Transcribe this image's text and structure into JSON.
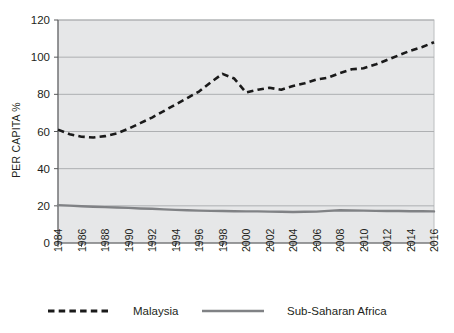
{
  "chart_data": {
    "type": "line",
    "title": "",
    "xlabel": "",
    "ylabel": "PER CAPITA %",
    "ylim": [
      0,
      120
    ],
    "ytick_values": [
      0,
      20,
      40,
      60,
      80,
      100,
      120
    ],
    "ytick_labels": [
      "0",
      "20",
      "40",
      "60",
      "80",
      "100",
      "120"
    ],
    "xlim": [
      1984,
      2016
    ],
    "xtick_labels": [
      "1984",
      "1986",
      "1988",
      "1990",
      "1992",
      "1994",
      "1996",
      "1998",
      "2000",
      "2002",
      "2004",
      "2006",
      "2008",
      "2010",
      "2012",
      "2014",
      "2016"
    ],
    "x": [
      1984,
      1985,
      1986,
      1987,
      1988,
      1989,
      1990,
      1991,
      1992,
      1993,
      1994,
      1995,
      1996,
      1997,
      1998,
      1999,
      2000,
      2001,
      2002,
      2003,
      2004,
      2005,
      2006,
      2007,
      2008,
      2009,
      2010,
      2011,
      2012,
      2013,
      2014,
      2015,
      2016
    ],
    "grid": true,
    "legend_position": "bottom",
    "series": [
      {
        "name": "Malaysia",
        "style": "dashed",
        "color": "#1a1a1a",
        "values": [
          61.0,
          58.5,
          57.2,
          56.8,
          57.5,
          59.0,
          61.5,
          64.5,
          67.5,
          71.0,
          74.5,
          78.0,
          81.5,
          86.5,
          91.0,
          88.5,
          81.0,
          82.5,
          83.5,
          82.5,
          84.5,
          86.0,
          88.0,
          89.0,
          91.5,
          93.5,
          94.0,
          96.0,
          98.5,
          101.0,
          103.5,
          105.5,
          108.0
        ]
      },
      {
        "name": "Sub-Saharan Africa",
        "style": "solid",
        "color": "#808285",
        "values": [
          20.4,
          20.1,
          19.8,
          19.5,
          19.3,
          19.1,
          18.9,
          18.6,
          18.4,
          18.1,
          17.8,
          17.6,
          17.4,
          17.3,
          17.2,
          17.1,
          17.0,
          17.0,
          16.9,
          16.8,
          16.7,
          16.8,
          16.9,
          17.3,
          17.6,
          17.5,
          17.4,
          17.3,
          17.2,
          17.2,
          17.1,
          17.1,
          17.0
        ]
      }
    ]
  },
  "legend": {
    "items": [
      {
        "label": "Malaysia",
        "style": "dashed"
      },
      {
        "label": "Sub-Saharan Africa",
        "style": "solid"
      }
    ]
  },
  "axis": {
    "y_title": "PER CAPITA %"
  }
}
